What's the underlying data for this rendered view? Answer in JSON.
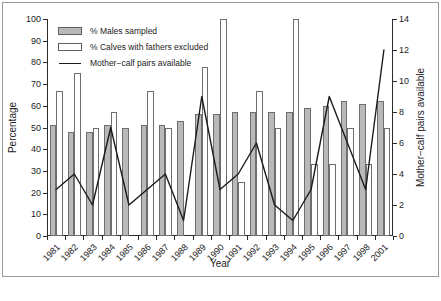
{
  "figure": {
    "border_color": "#9a9a9a",
    "background": "#ffffff"
  },
  "legend": {
    "position": "top-left-inside",
    "entries": [
      {
        "label": "% Males sampled",
        "key": "males-swatch",
        "color": "#b9b9b9"
      },
      {
        "label": "% Calves with fathers excluded",
        "key": "calves-swatch",
        "color": "#ffffff"
      },
      {
        "label": "Mother−calf pairs available",
        "key": "line-swatch",
        "color": "#1c1c1c"
      }
    ]
  },
  "chart_data": {
    "type": "bar",
    "title": "",
    "xlabel": "Year",
    "ylabel": "Percentage",
    "y2label": "Mother−calf pairs available",
    "ylim": [
      0,
      100
    ],
    "y2lim": [
      0,
      14
    ],
    "yticks": [
      0,
      10,
      20,
      30,
      40,
      50,
      60,
      70,
      80,
      90,
      100
    ],
    "y2ticks": [
      0,
      2,
      4,
      6,
      8,
      10,
      12,
      14
    ],
    "grid": false,
    "legend_position": "upper left",
    "categories": [
      "1981",
      "1982",
      "1983",
      "1984",
      "1985",
      "1986",
      "1987",
      "1988",
      "1989",
      "1990",
      "1991",
      "1992",
      "1993",
      "1994",
      "1995",
      "1996",
      "1997",
      "1998",
      "2001"
    ],
    "series": [
      {
        "name": "% Males sampled",
        "kind": "bar",
        "axis": "left",
        "unit": "%",
        "color": "#b9b9b9",
        "values": [
          51,
          48,
          48,
          51,
          50,
          51,
          51,
          53,
          56,
          56,
          57,
          57,
          57,
          57,
          59,
          60,
          62,
          61,
          62
        ]
      },
      {
        "name": "% Calves with fathers excluded",
        "kind": "bar",
        "axis": "left",
        "unit": "%",
        "color": "#ffffff",
        "values": [
          67,
          75,
          50,
          57,
          null,
          67,
          50,
          null,
          78,
          100,
          25,
          67,
          50,
          100,
          33,
          33,
          50,
          33,
          50
        ]
      },
      {
        "name": "Mother−calf pairs available",
        "kind": "line",
        "axis": "right",
        "unit": "pairs",
        "color": "#1c1c1c",
        "values": [
          3,
          4,
          2,
          7,
          2,
          3,
          4,
          1,
          9,
          3,
          4,
          6,
          2,
          1,
          3,
          9,
          6,
          3,
          12
        ]
      }
    ]
  }
}
